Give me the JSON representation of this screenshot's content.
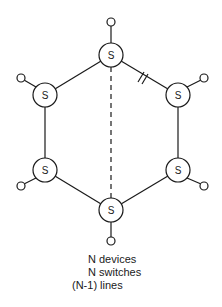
{
  "diagram": {
    "type": "ring-topology",
    "switch_label": "S",
    "switches": [
      {
        "id": "top",
        "label": "S"
      },
      {
        "id": "top-right",
        "label": "S"
      },
      {
        "id": "bottom-right",
        "label": "S"
      },
      {
        "id": "bottom",
        "label": "S"
      },
      {
        "id": "bottom-left",
        "label": "S"
      },
      {
        "id": "top-left",
        "label": "S"
      }
    ],
    "break_marker": "top to top-right link is broken (//)",
    "dashed_link": "top to bottom"
  },
  "caption": {
    "line1": "N devices",
    "line2": "N switches",
    "line3": "(N-1) lines"
  }
}
